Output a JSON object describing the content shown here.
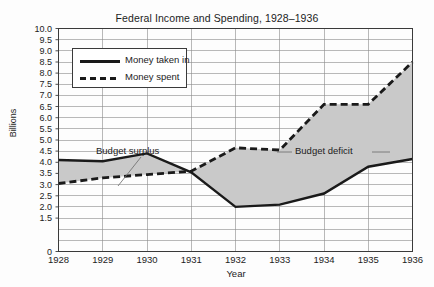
{
  "chart_data": {
    "type": "line",
    "title": "Federal Income and Spending, 1928–1936",
    "xlabel": "Year",
    "ylabel": "Billions",
    "categories": [
      "1928",
      "1929",
      "1930",
      "1931",
      "1932",
      "1933",
      "1934",
      "1935",
      "1936"
    ],
    "x": [
      1928,
      1929,
      1930,
      1931,
      1932,
      1933,
      1934,
      1935,
      1936
    ],
    "series": [
      {
        "name": "Money taken in",
        "style": "solid",
        "values": [
          4.1,
          4.05,
          4.4,
          3.55,
          2.0,
          2.1,
          2.6,
          3.8,
          4.15
        ]
      },
      {
        "name": "Money spent",
        "style": "dashed",
        "values": [
          3.05,
          3.3,
          3.45,
          3.6,
          4.65,
          4.55,
          6.6,
          6.6,
          8.5
        ]
      }
    ],
    "ylim": [
      0,
      10.0
    ],
    "ytick_labels": [
      "10.0",
      "9.5",
      "9.0",
      "8.5",
      "8.0",
      "7.5",
      "7.0",
      "6.5",
      "6.0",
      "5.5",
      "5.0",
      "4.5",
      "4.0",
      "3.5",
      "3.0",
      "2.5",
      "2.0",
      "1.5",
      "0"
    ],
    "ytick_values": [
      10.0,
      9.5,
      9.0,
      8.5,
      8.0,
      7.5,
      7.0,
      6.5,
      6.0,
      5.5,
      5.0,
      4.5,
      4.0,
      3.5,
      3.0,
      2.5,
      2.0,
      1.5,
      0
    ],
    "grid": true,
    "legend_position": "upper-left",
    "fill_between": {
      "label": "area between money spent and money taken in",
      "color": "#c9c9c9"
    },
    "annotations": [
      {
        "text": "Budget surplus",
        "points_to_year": 1928.85,
        "points_to_value": 3.6
      },
      {
        "text": "Budget deficit",
        "points_to_year": 1933.0,
        "points_to_value": 5.05
      }
    ],
    "colors": {
      "line": "#1a1a1a",
      "fill": "#c9c9c9",
      "grid": "#8a8a8a",
      "axis": "#3a3a3a",
      "background": "#fdfdfd"
    }
  },
  "legend": {
    "items": [
      {
        "label": "Money taken in",
        "style": "solid"
      },
      {
        "label": "Money spent",
        "style": "dashed"
      }
    ]
  }
}
